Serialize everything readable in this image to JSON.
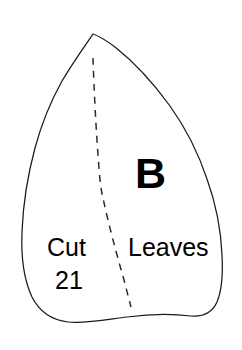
{
  "document": {
    "type": "sewing-pattern-template",
    "title": "Leaf Pattern Piece B",
    "background_color": "#ffffff",
    "outline_color": "#1a1a1a",
    "text_color": "#000000"
  },
  "pattern_piece": {
    "letter_label": "B",
    "name_label": "Leaves",
    "instruction_label": "Cut",
    "quantity_label": "21",
    "shape_name": "leaf-outline",
    "fold_line_name": "center-vein-dashed-line",
    "fold_line_style": "dashed"
  }
}
